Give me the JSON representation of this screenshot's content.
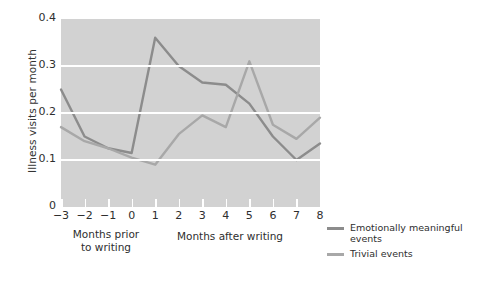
{
  "chart_data": {
    "type": "line",
    "title": "",
    "xlabel": "",
    "ylabel": "Illness visits per month",
    "x": [
      -3,
      -2,
      -1,
      0,
      1,
      2,
      3,
      4,
      5,
      6,
      7,
      8
    ],
    "xticklabels": [
      "−3",
      "−2",
      "−1",
      "0",
      "1",
      "2",
      "3",
      "4",
      "5",
      "6",
      "7",
      "8"
    ],
    "yticklabels": [
      "0",
      "0.1",
      "0.2",
      "0.3",
      "0.4"
    ],
    "yticks": [
      0,
      0.1,
      0.2,
      0.3,
      0.4
    ],
    "ylim": [
      0,
      0.4
    ],
    "xlim": [
      -3,
      8
    ],
    "grid": "horizontal-white",
    "legend_position": "right",
    "series": [
      {
        "name": "Emotionally meaningful events",
        "color": "#8c8c8c",
        "values": [
          0.25,
          0.15,
          0.125,
          0.115,
          0.36,
          0.3,
          0.265,
          0.26,
          0.22,
          0.15,
          0.1,
          0.135
        ]
      },
      {
        "name": "Trivial events",
        "color": "#a8a8a8",
        "values": [
          0.17,
          0.14,
          0.125,
          0.105,
          0.09,
          0.155,
          0.195,
          0.17,
          0.31,
          0.175,
          0.145,
          0.19
        ]
      }
    ],
    "annotations": {
      "group_prior": "Months prior\nto writing",
      "group_prior_line1": "Months prior",
      "group_prior_line2": "to writing",
      "group_after": "Months after writing"
    },
    "panel_background": "#d2d2d2",
    "figure_background": "#ffffff"
  },
  "legend": {
    "items": [
      {
        "label_line1": "Emotionally meaningful",
        "label_line2": "events"
      },
      {
        "label_line1": "Trivial events",
        "label_line2": ""
      }
    ]
  }
}
